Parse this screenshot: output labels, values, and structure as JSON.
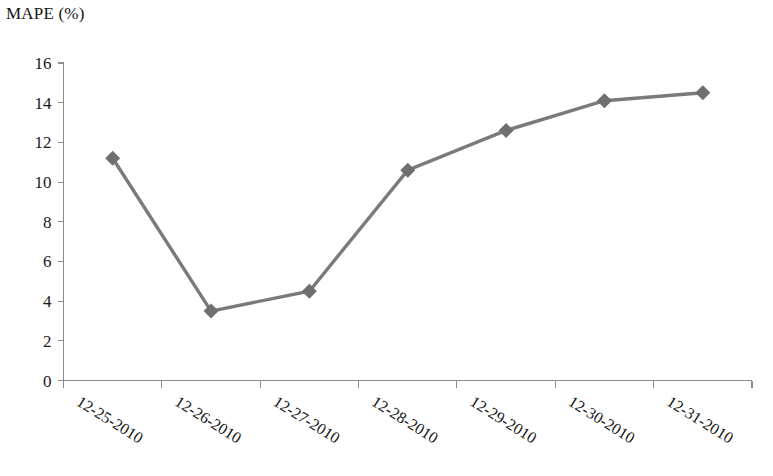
{
  "chart_data": {
    "type": "line",
    "title": "MAPE (%)",
    "xlabel": "",
    "ylabel": "",
    "categories": [
      "12-25-2010",
      "12-26-2010",
      "12-27-2010",
      "12-28-2010",
      "12-29-2010",
      "12-30-2010",
      "12-31-2010"
    ],
    "values": [
      11.2,
      3.5,
      4.5,
      10.6,
      12.6,
      14.1,
      14.5
    ],
    "series": [
      {
        "name": "MAPE (%)",
        "values": [
          11.2,
          3.5,
          4.5,
          10.6,
          12.6,
          14.1,
          14.5
        ],
        "color": "#7a7a7a",
        "marker": "diamond"
      }
    ],
    "ylim": [
      0,
      16
    ],
    "ytick_labels": [
      "0",
      "2",
      "4",
      "6",
      "8",
      "10",
      "12",
      "14",
      "16"
    ],
    "ytick_values": [
      0,
      2,
      4,
      6,
      8,
      10,
      12,
      14,
      16
    ],
    "grid": false,
    "legend": false,
    "legend_position": "none",
    "xtick_label_rotation_deg": -32,
    "axis_color": "#8c8c8c",
    "line_color": "#7a7a7a",
    "marker_color": "#6f6f6f",
    "background_color": "#ffffff"
  }
}
